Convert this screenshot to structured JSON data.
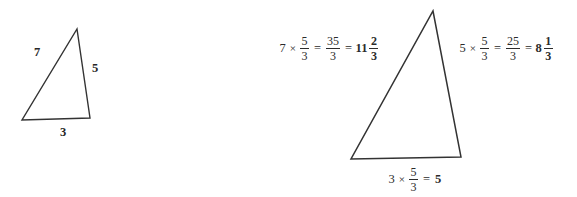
{
  "figure": {
    "title_visible": false,
    "background_color": "#ffffff",
    "stroke_color": "#333333",
    "text_color": "#2b2b2b",
    "scale_factor": "5/3"
  },
  "original_triangle": {
    "name": "original-triangle",
    "side_labels": {
      "left": "7",
      "right": "5",
      "bottom": "3"
    },
    "vertices": {
      "apex": [
        77,
        29
      ],
      "bottom_left": [
        22,
        120
      ],
      "bottom_right": [
        90,
        118
      ]
    }
  },
  "scaled_triangle": {
    "name": "scaled-triangle",
    "vertices": {
      "apex": [
        433,
        11
      ],
      "bottom_left": [
        351,
        159
      ],
      "bottom_right": [
        461,
        157
      ]
    }
  },
  "expressions": {
    "left_side": {
      "id": "left-side-expression",
      "factor": "7",
      "times": "×",
      "scale_num": "5",
      "scale_den": "3",
      "equals_1": "=",
      "improper_num": "35",
      "improper_den": "3",
      "equals_2": "=",
      "result_whole": "11",
      "result_num": "2",
      "result_den": "3",
      "plain_text": "7 × 5/3 = 35/3 = 11 2/3"
    },
    "right_side": {
      "id": "right-side-expression",
      "factor": "5",
      "times": "×",
      "scale_num": "5",
      "scale_den": "3",
      "equals_1": "=",
      "improper_num": "25",
      "improper_den": "3",
      "equals_2": "=",
      "result_whole": "8",
      "result_num": "1",
      "result_den": "3",
      "plain_text": "5 × 5/3 = 25/3 = 8 1/3"
    },
    "bottom_side": {
      "id": "bottom-side-expression",
      "factor": "3",
      "times": "×",
      "scale_num": "5",
      "scale_den": "3",
      "equals_1": "=",
      "result_whole": "5",
      "plain_text": "3 × 5/3 = 5"
    }
  }
}
